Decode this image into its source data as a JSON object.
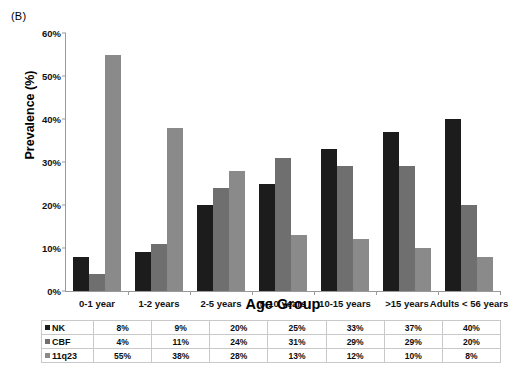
{
  "panel_label": "(B)",
  "chart_data": {
    "type": "bar",
    "title": "",
    "xlabel": "Age Group",
    "ylabel": "Prevalence (%)",
    "ylim": [
      0,
      60
    ],
    "ytick_values": [
      0,
      10,
      20,
      30,
      40,
      50,
      60
    ],
    "ytick_labels": [
      "0%",
      "10%",
      "20%",
      "30%",
      "40%",
      "50%",
      "60%"
    ],
    "grid": false,
    "legend_position": "table-row-labels",
    "categories": [
      "0-1 year",
      "1-2 years",
      "2-5 years",
      "5-10 years",
      "10-15 years",
      ">15 years",
      "Adults < 56 years"
    ],
    "series": [
      {
        "name": "NK",
        "color": "#1c1c1c",
        "values": [
          8,
          9,
          20,
          25,
          33,
          37,
          40
        ]
      },
      {
        "name": "CBF",
        "color": "#6f6f6f",
        "values": [
          4,
          11,
          24,
          31,
          29,
          29,
          20
        ]
      },
      {
        "name": "11q23",
        "color": "#8a8a8a",
        "values": [
          55,
          38,
          28,
          13,
          12,
          10,
          8
        ]
      }
    ]
  },
  "table": {
    "rows": [
      {
        "label": "NK",
        "cells": [
          "8%",
          "9%",
          "20%",
          "25%",
          "33%",
          "37%",
          "40%"
        ]
      },
      {
        "label": "CBF",
        "cells": [
          "4%",
          "11%",
          "24%",
          "31%",
          "29%",
          "29%",
          "20%"
        ]
      },
      {
        "label": "11q23",
        "cells": [
          "55%",
          "38%",
          "28%",
          "13%",
          "12%",
          "10%",
          "8%"
        ]
      }
    ]
  }
}
